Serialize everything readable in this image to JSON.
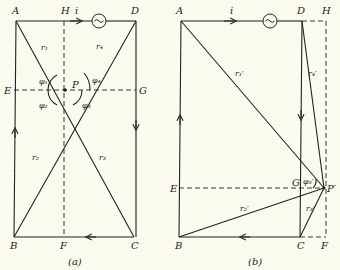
{
  "figure": {
    "panel_a": {
      "caption": "(a)",
      "vertices": {
        "A": "A",
        "H": "H",
        "D": "D",
        "E": "E",
        "G": "G",
        "B": "B",
        "F": "F",
        "C": "C",
        "P": "P"
      },
      "current_label": "i",
      "source_symbol": "~",
      "radii": {
        "r1": "r₁",
        "r2": "r₂",
        "r3": "r₃",
        "r4": "r₄"
      },
      "angles": {
        "phi1": "φ₁",
        "phi2": "φ₂",
        "phi3": "φ₃",
        "phi4": "φ₄"
      }
    },
    "panel_b": {
      "caption": "(b)",
      "vertices": {
        "A": "A",
        "D": "D",
        "H": "H",
        "E": "E",
        "G": "G",
        "B": "B",
        "C": "C",
        "F": "F",
        "P": "P′"
      },
      "current_label": "i",
      "source_symbol": "~",
      "radii": {
        "r1": "r₁′",
        "r2": "r₂′",
        "r3": "r₃′",
        "r4": "r₄′"
      },
      "angles": {
        "phi3": "φ₃′"
      }
    }
  }
}
